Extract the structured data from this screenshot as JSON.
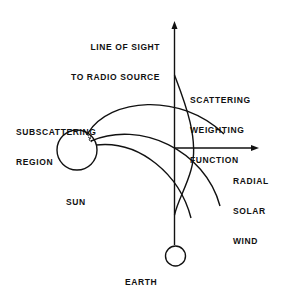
{
  "labels": {
    "line_of_sight": [
      "LINE OF SIGHT",
      "TO RADIO SOURCE"
    ],
    "scattering_weighting": [
      "SCATTERING",
      "WEIGHTING",
      "FUNCTION"
    ],
    "subscattering": [
      "SUBSCATTERING",
      "REGION"
    ],
    "sun": "SUN",
    "radial_solar_wind": [
      "RADIAL",
      "SOLAR",
      "WIND"
    ],
    "earth": "EARTH"
  },
  "colors": {
    "stroke": "#111111",
    "background": "#ffffff"
  }
}
